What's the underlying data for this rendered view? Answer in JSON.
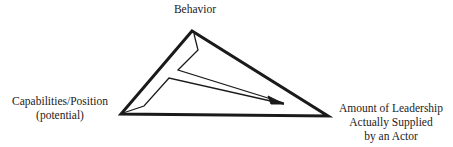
{
  "diagram": {
    "type": "triangle-with-inner-arrow",
    "vertices": {
      "top": {
        "label": "Behavior"
      },
      "left": {
        "lines": [
          "Capabilities/Position",
          "(potential)"
        ]
      },
      "right": {
        "lines": [
          "Amount of Leadership",
          "Actually Supplied",
          "by an Actor"
        ]
      }
    },
    "colors": {
      "stroke": "#1a1a1a",
      "background": "#ffffff",
      "text": "#222222"
    }
  }
}
